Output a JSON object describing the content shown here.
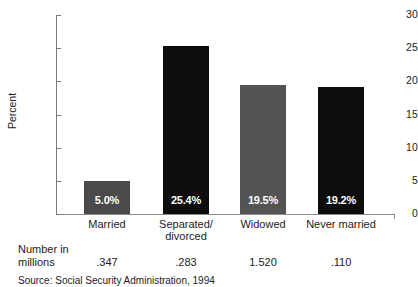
{
  "chart_data": {
    "type": "bar",
    "title": "",
    "xlabel": "",
    "ylabel": "Percent",
    "ylim": [
      0,
      30
    ],
    "yticks": [
      0,
      5,
      10,
      15,
      20,
      25,
      30
    ],
    "grid": false,
    "legend": "none",
    "categories": [
      "Married",
      "Separated/\ndivorced",
      "Widowed",
      "Never married"
    ],
    "values": [
      5.0,
      25.4,
      19.5,
      19.2
    ],
    "data_labels": [
      "5.0%",
      "25.4%",
      "19.5%",
      "19.2%"
    ],
    "bar_colors": [
      "#4a4a4a",
      "#0d0d0d",
      "#545454",
      "#0d0d0d"
    ],
    "secondary_row": {
      "label_line1": "Number in",
      "label_line2": "millions",
      "values": [
        ".347",
        ".283",
        "1.520",
        ".110"
      ]
    },
    "source": "Source: Social Security Administration, 1994"
  },
  "axis": {
    "tick_labels": [
      "30",
      "25",
      "20",
      "15",
      "10",
      "5",
      "0"
    ],
    "y_title": "Percent"
  },
  "categories": [
    {
      "line1": "Married",
      "line2": ""
    },
    {
      "line1": "Separated/",
      "line2": "divorced"
    },
    {
      "line1": "Widowed",
      "line2": ""
    },
    {
      "line1": "Never married",
      "line2": ""
    }
  ],
  "bars": [
    {
      "label": "5.0%",
      "value": 5.0,
      "color": "#4a4a4a"
    },
    {
      "label": "25.4%",
      "value": 25.4,
      "color": "#0d0d0d"
    },
    {
      "label": "19.5%",
      "value": 19.5,
      "color": "#545454"
    },
    {
      "label": "19.2%",
      "value": 19.2,
      "color": "#0d0d0d"
    }
  ],
  "footer": {
    "number_label_line1": "Number in",
    "number_label_line2": "millions",
    "numbers": [
      ".347",
      ".283",
      "1.520",
      ".110"
    ],
    "source": "Source: Social Security Administration, 1994"
  }
}
